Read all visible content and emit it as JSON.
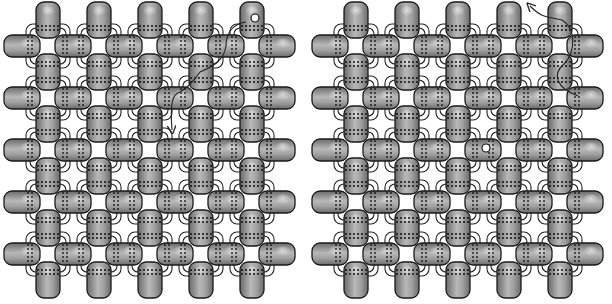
{
  "figure": {
    "title": "Right-angle weave bead diagram",
    "panels": [
      {
        "id": "left",
        "offset_x": 0,
        "start_marker": {
          "col": 4,
          "row": 0
        },
        "arrow": "down"
      },
      {
        "id": "right",
        "offset_x": 308,
        "start_marker": {
          "col": 3,
          "row": 2
        },
        "arrow": "up-left"
      }
    ],
    "grid": {
      "vertical_bead_cols_x": [
        48,
        99,
        150,
        201,
        252
      ],
      "vertical_bead_rows_y": [
        20,
        72,
        124,
        176,
        228,
        280
      ],
      "horizontal_bead_cols_x": [
        22,
        73,
        124,
        175,
        226,
        277
      ],
      "horizontal_bead_rows_y": [
        46,
        98,
        150,
        202,
        254
      ]
    },
    "colors": {
      "bead_dark": "#6e6e6e",
      "bead_mid": "#9a9a9a",
      "bead_light": "#d8d8d8",
      "outline": "#1a1a1a",
      "thread": "#222222",
      "background": "#ffffff"
    }
  }
}
